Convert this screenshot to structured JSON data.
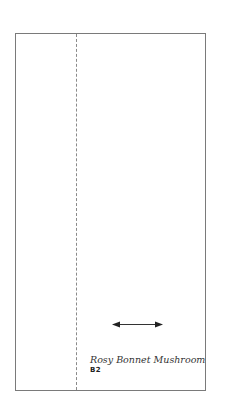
{
  "card": {
    "title": "Rosy Bonnet Mushroom",
    "code": "B2"
  },
  "icons": {
    "arrow": "double-headed-horizontal-arrow"
  },
  "colors": {
    "border": "#7a7a7a",
    "fold_line": "#8a8a8a",
    "text": "#333333"
  }
}
